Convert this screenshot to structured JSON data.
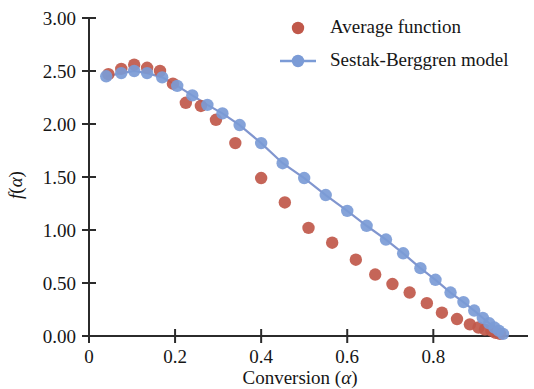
{
  "chart_data": {
    "type": "scatter",
    "title": "",
    "xlabel": "Conversion (α)",
    "ylabel": "f(α)",
    "xlim": [
      0,
      1.02
    ],
    "ylim": [
      0,
      3.0
    ],
    "xticks": [
      "0",
      "0.2",
      "0.4",
      "0.6",
      "0.8"
    ],
    "xtick_values": [
      0,
      0.2,
      0.4,
      0.6,
      0.8
    ],
    "yticks": [
      "0.00",
      "0.50",
      "1.00",
      "1.50",
      "2.00",
      "2.50",
      "3.00"
    ],
    "ytick_values": [
      0,
      0.5,
      1.0,
      1.5,
      2.0,
      2.5,
      3.0
    ],
    "grid": false,
    "legend_position": "top-right",
    "series": [
      {
        "name": "Average function",
        "marker": "circle",
        "color": "#c0584a",
        "line": false,
        "x": [
          0.045,
          0.075,
          0.105,
          0.135,
          0.165,
          0.195,
          0.225,
          0.26,
          0.295,
          0.34,
          0.4,
          0.455,
          0.51,
          0.565,
          0.62,
          0.665,
          0.705,
          0.745,
          0.785,
          0.82,
          0.855,
          0.885,
          0.905,
          0.92,
          0.935,
          0.945,
          0.955
        ],
        "y": [
          2.47,
          2.52,
          2.56,
          2.53,
          2.5,
          2.38,
          2.2,
          2.17,
          2.04,
          1.82,
          1.49,
          1.26,
          1.02,
          0.88,
          0.72,
          0.58,
          0.49,
          0.41,
          0.31,
          0.22,
          0.16,
          0.11,
          0.08,
          0.06,
          0.05,
          0.03,
          0.02
        ]
      },
      {
        "name": "Sestak-Berggren model",
        "marker": "circle",
        "color": "#7b9bd6",
        "line": true,
        "x": [
          0.04,
          0.075,
          0.105,
          0.135,
          0.17,
          0.205,
          0.24,
          0.275,
          0.31,
          0.35,
          0.4,
          0.45,
          0.5,
          0.55,
          0.6,
          0.645,
          0.69,
          0.73,
          0.77,
          0.805,
          0.84,
          0.87,
          0.895,
          0.915,
          0.93,
          0.942,
          0.952,
          0.962
        ],
        "y": [
          2.45,
          2.48,
          2.5,
          2.48,
          2.44,
          2.36,
          2.27,
          2.18,
          2.1,
          1.99,
          1.82,
          1.63,
          1.49,
          1.33,
          1.18,
          1.04,
          0.91,
          0.78,
          0.64,
          0.53,
          0.41,
          0.32,
          0.24,
          0.17,
          0.12,
          0.08,
          0.05,
          0.02
        ]
      }
    ]
  },
  "legend": {
    "entries": [
      {
        "label": "Average function",
        "color": "#c0584a",
        "type": "marker"
      },
      {
        "label": "Sestak-Berggren model",
        "color": "#7b9bd6",
        "type": "line-marker"
      }
    ]
  },
  "axes": {
    "x_title_main": "Conversion (",
    "x_title_symbol": "α",
    "x_title_close": ")",
    "y_title_f": "f",
    "y_title_open": "(",
    "y_title_symbol": "α",
    "y_title_close": ")"
  }
}
